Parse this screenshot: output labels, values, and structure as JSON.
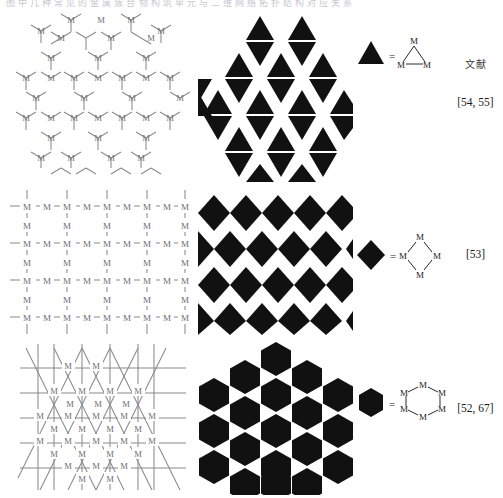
{
  "figure": {
    "top_caption": "图 中 几 种 常 见 的 金 属 簇 合 物 构 筑 单 元 与 二 维 网 络 拓 扑 结 构 对 应 关 系",
    "atom_label": "M",
    "equals_sign": "=",
    "references_header": "文献"
  },
  "rows": [
    {
      "id": "row-triangle",
      "network_name": "honeycomb-network",
      "tiling_name": "trihexagonal-triangle-tiling",
      "shape": "triangle",
      "cluster": "M3 triangular cluster",
      "cluster_atoms": [
        "M",
        "M",
        "M"
      ],
      "reference": "[54, 55]"
    },
    {
      "id": "row-diamond",
      "network_name": "square-grid-network",
      "tiling_name": "checkerboard-diamond-tiling",
      "shape": "diamond",
      "cluster": "M4 square cluster",
      "cluster_atoms": [
        "M",
        "M",
        "M",
        "M"
      ],
      "reference": "[53]"
    },
    {
      "id": "row-hexagon",
      "network_name": "triangular-lattice-network",
      "tiling_name": "hexagonal-packing-tiling",
      "shape": "hexagon",
      "cluster": "M6 hexagonal cluster",
      "cluster_atoms": [
        "M",
        "M",
        "M",
        "M",
        "M",
        "M"
      ],
      "reference": "[52, 67]"
    }
  ],
  "colors": {
    "solid_shape": "#111111",
    "bond_line": "#8a8a8f",
    "atom_text": "#6e6e72",
    "background": "#ffffff"
  }
}
